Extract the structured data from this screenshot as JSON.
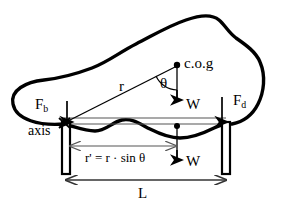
{
  "figure": {
    "type": "free-body-diagram",
    "colors": {
      "outline": "#000000",
      "thin_line": "#555555",
      "background": "#ffffff",
      "text": "#000000"
    }
  },
  "labels": {
    "buoyancy_force": "F",
    "buoyancy_force_sub": "b",
    "drag_force": "F",
    "drag_force_sub": "d",
    "weight_upper": "W",
    "weight_lower": "W",
    "center_of_gravity": "c.o.g",
    "axis": "axis",
    "radius": "r",
    "theta": "θ",
    "projected_radius_equation": "r' = r · sin θ",
    "span": "L"
  },
  "geometry": {
    "cog_point": {
      "x": 177,
      "y": 65
    },
    "axis_point": {
      "x": 64,
      "y": 123
    },
    "hull_contact_point": {
      "x": 177,
      "y": 127
    },
    "left_leg": {
      "x": 62,
      "y": 122,
      "width": 8,
      "height": 52
    },
    "right_leg": {
      "x": 222,
      "y": 122,
      "width": 8,
      "height": 52
    },
    "beam": {
      "x1": 64,
      "y1": 123,
      "x2": 226,
      "y2": 123
    },
    "r_dimension": {
      "x1": 68,
      "x2": 177,
      "y": 146
    },
    "span_dimension": {
      "x1": 66,
      "x2": 226,
      "y": 180
    }
  },
  "annotations": [
    {
      "name": "buoyancy-arrow",
      "direction": "up",
      "at_x": 67,
      "from_y": 122,
      "to_y": 99
    },
    {
      "name": "drag-arrow",
      "direction": "up",
      "at_x": 222,
      "from_y": 122,
      "to_y": 95
    },
    {
      "name": "weight-arrow-upper",
      "direction": "down",
      "at_x": 177,
      "from_y": 66,
      "to_y": 104
    },
    {
      "name": "weight-arrow-lower",
      "direction": "down",
      "at_x": 177,
      "from_y": 128,
      "to_y": 163
    }
  ]
}
